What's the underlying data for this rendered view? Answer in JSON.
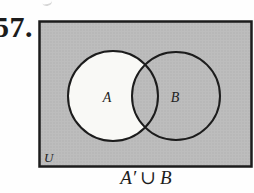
{
  "problem_number": "57.",
  "diagram": {
    "labels": {
      "universal": "U",
      "set_a": "A",
      "set_b": "B"
    },
    "caption": {
      "set_a_complement": "A′",
      "union_symbol": "∪",
      "set_b": "B"
    },
    "colors": {
      "shaded_fill": "#bdbdbd",
      "shaded_dot": "#b1b1b1",
      "unshaded_fill": "#f9f9f6",
      "outline": "#1c1c1c"
    }
  }
}
